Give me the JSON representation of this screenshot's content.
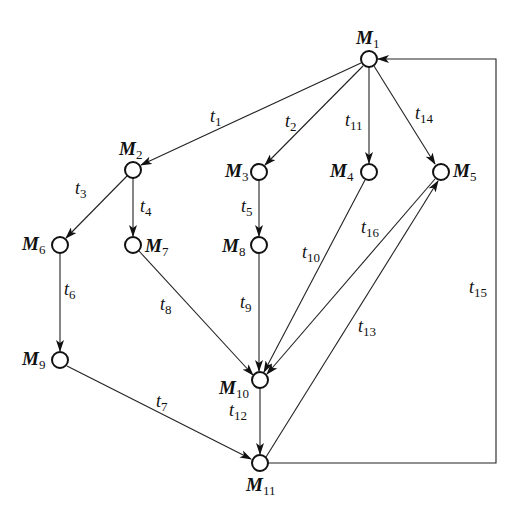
{
  "diagram": {
    "type": "state-transition-graph",
    "colors": {
      "stroke": "#222222",
      "node_fill": "#ffffff",
      "background": "#ffffff"
    },
    "nodes": [
      {
        "id": "M1",
        "label": "M",
        "sub": "1",
        "x": 369,
        "y": 59
      },
      {
        "id": "M2",
        "label": "M",
        "sub": "2",
        "x": 133,
        "y": 170
      },
      {
        "id": "M3",
        "label": "M",
        "sub": "3",
        "x": 259,
        "y": 172
      },
      {
        "id": "M4",
        "label": "M",
        "sub": "4",
        "x": 369,
        "y": 172
      },
      {
        "id": "M5",
        "label": "M",
        "sub": "5",
        "x": 441,
        "y": 172
      },
      {
        "id": "M6",
        "label": "M",
        "sub": "6",
        "x": 60,
        "y": 245
      },
      {
        "id": "M7",
        "label": "M",
        "sub": "7",
        "x": 133,
        "y": 245
      },
      {
        "id": "M8",
        "label": "M",
        "sub": "8",
        "x": 259,
        "y": 245
      },
      {
        "id": "M9",
        "label": "M",
        "sub": "9",
        "x": 60,
        "y": 360
      },
      {
        "id": "M10",
        "label": "M",
        "sub": "10",
        "x": 260,
        "y": 380
      },
      {
        "id": "M11",
        "label": "M",
        "sub": "11",
        "x": 260,
        "y": 463
      }
    ],
    "edges": [
      {
        "id": "t1",
        "label": "t",
        "sub": "1",
        "from": "M1",
        "to": "M2"
      },
      {
        "id": "t2",
        "label": "t",
        "sub": "2",
        "from": "M1",
        "to": "M3"
      },
      {
        "id": "t3",
        "label": "t",
        "sub": "3",
        "from": "M2",
        "to": "M6"
      },
      {
        "id": "t4",
        "label": "t",
        "sub": "4",
        "from": "M2",
        "to": "M7"
      },
      {
        "id": "t5",
        "label": "t",
        "sub": "5",
        "from": "M3",
        "to": "M8"
      },
      {
        "id": "t6",
        "label": "t",
        "sub": "6",
        "from": "M6",
        "to": "M9"
      },
      {
        "id": "t7",
        "label": "t",
        "sub": "7",
        "from": "M9",
        "to": "M11"
      },
      {
        "id": "t8",
        "label": "t",
        "sub": "8",
        "from": "M7",
        "to": "M10"
      },
      {
        "id": "t9",
        "label": "t",
        "sub": "9",
        "from": "M8",
        "to": "M10"
      },
      {
        "id": "t10",
        "label": "t",
        "sub": "10",
        "from": "M4",
        "to": "M10"
      },
      {
        "id": "t11",
        "label": "t",
        "sub": "11",
        "from": "M1",
        "to": "M4"
      },
      {
        "id": "t12",
        "label": "t",
        "sub": "12",
        "from": "M10",
        "to": "M11"
      },
      {
        "id": "t13",
        "label": "t",
        "sub": "13",
        "from": "M11",
        "to": "M5"
      },
      {
        "id": "t14",
        "label": "t",
        "sub": "14",
        "from": "M1",
        "to": "M5"
      },
      {
        "id": "t15",
        "label": "t",
        "sub": "15",
        "from": "M11",
        "to": "M1"
      },
      {
        "id": "t16",
        "label": "t",
        "sub": "16",
        "from": "M5",
        "to": "M10"
      }
    ]
  }
}
